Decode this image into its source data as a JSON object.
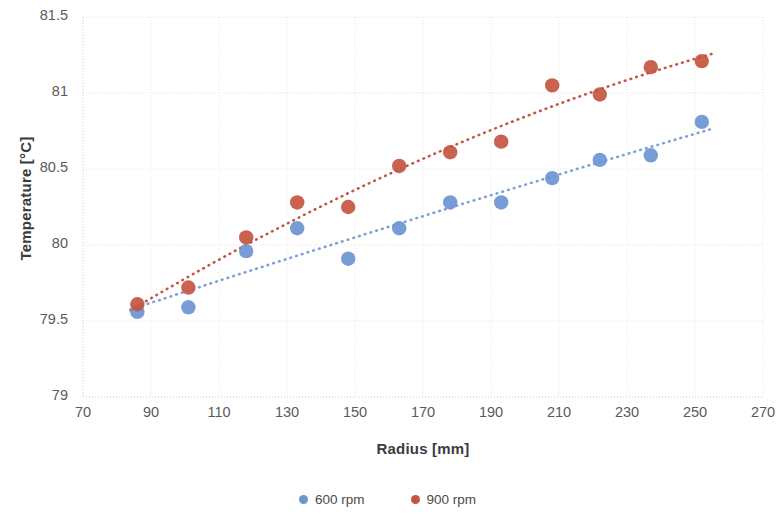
{
  "chart_data": {
    "type": "scatter",
    "title": "",
    "xlabel": "Radius [mm]",
    "ylabel": "Temperature [°C]",
    "xlim": [
      70,
      270
    ],
    "ylim": [
      79,
      81.5
    ],
    "xticks": [
      70,
      90,
      110,
      130,
      150,
      170,
      190,
      210,
      230,
      250,
      270
    ],
    "yticks": [
      79,
      79.5,
      80,
      80.5,
      81,
      81.5
    ],
    "xtick_labels": [
      "70",
      "90",
      "110",
      "130",
      "150",
      "170",
      "190",
      "210",
      "230",
      "250",
      "270"
    ],
    "ytick_labels": [
      "79",
      "79.5",
      "80",
      "80.5",
      "81",
      "81.5"
    ],
    "grid": true,
    "legend_position": "bottom",
    "series": [
      {
        "name": "600 rpm",
        "color": "#6d95d2",
        "marker": "circle",
        "trendline": {
          "style": "dotted",
          "color": "#7b9fd6"
        },
        "x": [
          86,
          101,
          118,
          133,
          148,
          163,
          178,
          193,
          208,
          222,
          237,
          252
        ],
        "values": [
          79.56,
          79.59,
          79.96,
          80.11,
          79.91,
          80.11,
          80.28,
          80.28,
          80.44,
          80.56,
          80.59,
          80.81
        ]
      },
      {
        "name": "900 rpm",
        "color": "#c4553f",
        "marker": "circle",
        "trendline": {
          "style": "dotted",
          "color": "#c4553f"
        },
        "x": [
          86,
          101,
          118,
          133,
          148,
          163,
          178,
          193,
          208,
          222,
          237,
          252
        ],
        "values": [
          79.61,
          79.72,
          80.05,
          80.28,
          80.25,
          80.52,
          80.61,
          80.68,
          81.05,
          80.99,
          81.17,
          81.21
        ]
      }
    ]
  },
  "axes": {
    "x_title": "Radius [mm]",
    "y_title": "Temperature [°C]"
  },
  "legend": {
    "items": [
      {
        "label": "600 rpm",
        "color": "#6d95d2"
      },
      {
        "label": "900 rpm",
        "color": "#c4553f"
      }
    ]
  }
}
